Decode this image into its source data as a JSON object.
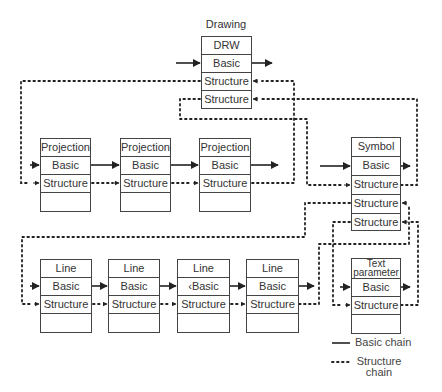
{
  "drawing": {
    "title": "Drawing",
    "cells": [
      "DRW",
      "Basic",
      "Structure",
      "Structure"
    ]
  },
  "projections": [
    {
      "cells": [
        "Projection",
        "Basic",
        "Structure",
        ""
      ]
    },
    {
      "cells": [
        "Projection",
        "Basic",
        "Structure",
        ""
      ]
    },
    {
      "cells": [
        "Projection",
        "Basic",
        "Structure",
        ""
      ]
    }
  ],
  "symbol": {
    "cells": [
      "Symbol",
      "Basic",
      "Structure",
      "Structure",
      "Structure"
    ]
  },
  "lines": [
    {
      "cells": [
        "Line",
        "Basic",
        "Structure",
        ""
      ]
    },
    {
      "cells": [
        "Line",
        "Basic",
        "Structure",
        ""
      ]
    },
    {
      "cells": [
        "Line",
        "‹Basic",
        "Structure",
        ""
      ]
    },
    {
      "cells": [
        "Line",
        "Basic",
        "Structure",
        ""
      ]
    }
  ],
  "text_parameter": {
    "cells": [
      "Text parameter",
      "Basic",
      "Structure",
      ""
    ]
  },
  "legend": {
    "basic_chain": "Basic chain",
    "structure_chain": "Structure chain",
    "structure_line1": "Structure",
    "structure_line2": "chain"
  }
}
